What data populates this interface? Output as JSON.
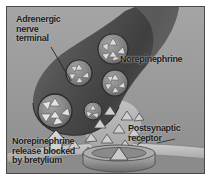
{
  "figure": {
    "background_color": "#9a9a9a",
    "frame_color": "#4a4a4a",
    "page_color": "#ffffff"
  },
  "labels": {
    "adrenergic_terminal": "Adrenergic\nnerve\nterminal",
    "norepinephrine": "Norepinephrine",
    "postsynaptic_receptor": "Postsynaptic\nreceptor",
    "release_blocked": "Norepinephrine\nrelease blocked\nby bretylium"
  },
  "structures": {
    "nerve_terminal": "adrenergic-nerve-terminal",
    "vesicles_count": 5,
    "free_transmitter_triangles": 12,
    "receptor": "postsynaptic-receptor-disc",
    "postsynaptic_membrane": "postsynaptic-membrane",
    "blocked_arrow": "blocked-release-arrow"
  },
  "colors": {
    "terminal_dark": "#4a4a4a",
    "terminal_mid": "#6e6e6e",
    "vesicle_fill": "#8d8d8d",
    "vesicle_stroke": "#2f2f2f",
    "granule_fill": "#d8d8d8",
    "cleft_fill": "#b4b4b4",
    "receptor_fill": "#9f9f9f",
    "membrane_fill": "#c3c3c3",
    "text": "#1d1d1d"
  }
}
